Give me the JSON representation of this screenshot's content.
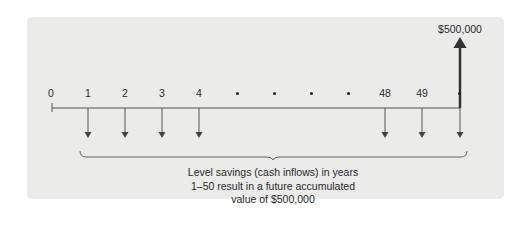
{
  "diagram": {
    "type": "cash-flow-timeline",
    "future_value_label": "$500,000",
    "timeline_points": [
      {
        "label": "0",
        "x": 51,
        "kind": "number",
        "outflow": false
      },
      {
        "label": "1",
        "x": 88,
        "kind": "number",
        "outflow": true
      },
      {
        "label": "2",
        "x": 125,
        "kind": "number",
        "outflow": true
      },
      {
        "label": "3",
        "x": 162,
        "kind": "number",
        "outflow": true
      },
      {
        "label": "4",
        "x": 199,
        "kind": "number",
        "outflow": true
      },
      {
        "label": "•",
        "x": 237,
        "kind": "ellipsis-dot",
        "outflow": false
      },
      {
        "label": "•",
        "x": 274,
        "kind": "ellipsis-dot",
        "outflow": false
      },
      {
        "label": "•",
        "x": 311,
        "kind": "ellipsis-dot",
        "outflow": false
      },
      {
        "label": "•",
        "x": 348,
        "kind": "ellipsis-dot",
        "outflow": false
      },
      {
        "label": "48",
        "x": 385,
        "kind": "number",
        "outflow": true
      },
      {
        "label": "49",
        "x": 422,
        "kind": "number",
        "outflow": true
      },
      {
        "label": "•",
        "x": 459,
        "kind": "ellipsis-dot",
        "outflow": true
      }
    ],
    "caption": {
      "line1": "Level savings (cash inflows) in years",
      "line2": "1–50 result in a future accumulated",
      "line3": "value of $500,000"
    },
    "colors": {
      "panel": "#ebebea",
      "line": "#555555",
      "arrow_up": "#333333",
      "text": "#2a2a2a"
    }
  }
}
